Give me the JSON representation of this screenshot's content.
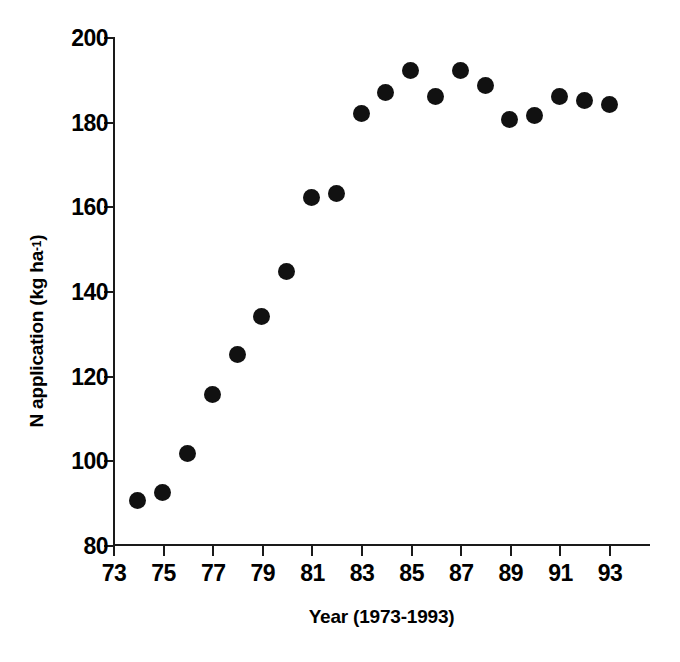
{
  "chart_data": {
    "type": "scatter",
    "title": "",
    "xlabel": "Year (1973-1993)",
    "ylabel": "N application (kg ha-1)",
    "ylabel_base": "N application (kg ha",
    "ylabel_sup": "-1",
    "ylabel_close": ")",
    "xlim": [
      1973,
      1994.65
    ],
    "ylim": [
      80,
      200
    ],
    "grid": false,
    "legend": null,
    "marker": "filled-circle",
    "marker_color": "#111111",
    "xticks": [
      1973,
      1975,
      1977,
      1979,
      1981,
      1983,
      1985,
      1987,
      1989,
      1991,
      1993
    ],
    "xtick_labels": [
      "73",
      "75",
      "77",
      "79",
      "81",
      "83",
      "85",
      "87",
      "89",
      "91",
      "93"
    ],
    "yticks": [
      80,
      100,
      120,
      140,
      160,
      180,
      200
    ],
    "ytick_labels": [
      "80",
      "100",
      "120",
      "140",
      "160",
      "180",
      "200"
    ],
    "x": [
      1974,
      1975,
      1976,
      1977,
      1978,
      1979,
      1980,
      1981,
      1982,
      1983,
      1984,
      1985,
      1986,
      1987,
      1988,
      1989,
      1990,
      1991,
      1992,
      1993
    ],
    "values": [
      90.5,
      92.5,
      101.5,
      115.5,
      125.0,
      134.0,
      144.5,
      162.0,
      163.0,
      182.0,
      187.0,
      192.0,
      186.0,
      192.0,
      188.5,
      180.5,
      181.5,
      186.0,
      185.0,
      184.0
    ],
    "points": [
      {
        "x": 1974,
        "y": 90.5
      },
      {
        "x": 1975,
        "y": 92.5
      },
      {
        "x": 1976,
        "y": 101.5
      },
      {
        "x": 1977,
        "y": 115.5
      },
      {
        "x": 1978,
        "y": 125.0
      },
      {
        "x": 1979,
        "y": 134.0
      },
      {
        "x": 1980,
        "y": 144.5
      },
      {
        "x": 1981,
        "y": 162.0
      },
      {
        "x": 1982,
        "y": 163.0
      },
      {
        "x": 1983,
        "y": 182.0
      },
      {
        "x": 1984,
        "y": 187.0
      },
      {
        "x": 1985,
        "y": 192.0
      },
      {
        "x": 1986,
        "y": 186.0
      },
      {
        "x": 1987,
        "y": 192.0
      },
      {
        "x": 1988,
        "y": 188.5
      },
      {
        "x": 1989,
        "y": 180.5
      },
      {
        "x": 1990,
        "y": 181.5
      },
      {
        "x": 1991,
        "y": 186.0
      },
      {
        "x": 1992,
        "y": 185.0
      },
      {
        "x": 1993,
        "y": 184.0
      }
    ]
  }
}
